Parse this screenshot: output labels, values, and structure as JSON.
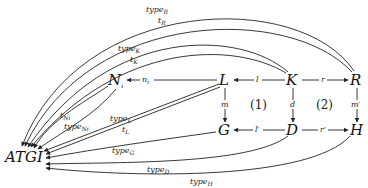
{
  "diagram": {
    "type": "commutative-diagram",
    "nodes": {
      "atgi": "ATGI",
      "ni": "N",
      "ni_sub": "i",
      "l": "L",
      "k": "K",
      "r": "R",
      "g": "G",
      "d": "D",
      "h": "H"
    },
    "regions": {
      "one": "(1)",
      "two": "(2)"
    },
    "edges": {
      "ni": {
        "base": "n",
        "sub": "i",
        "from": "L",
        "to": "N_i"
      },
      "l": {
        "base": "l",
        "from": "K",
        "to": "L"
      },
      "r": {
        "base": "r",
        "from": "K",
        "to": "R"
      },
      "m": {
        "base": "m",
        "from": "L",
        "to": "G"
      },
      "d": {
        "base": "d",
        "from": "K",
        "to": "D"
      },
      "mprime": {
        "base": "m′",
        "from": "R",
        "to": "H"
      },
      "lprime": {
        "base": "l′",
        "from": "D",
        "to": "G"
      },
      "rprime": {
        "base": "r′",
        "from": "D",
        "to": "H"
      },
      "type_r": {
        "base": "type",
        "sub": "R",
        "from": "R",
        "to": "ATGI"
      },
      "t_r": {
        "base": "t",
        "sub": "R",
        "from": "R",
        "to": "ATGI"
      },
      "type_k": {
        "base": "type",
        "sub": "K",
        "from": "K",
        "to": "ATGI"
      },
      "t_k": {
        "base": "t",
        "sub": "K",
        "from": "K",
        "to": "ATGI"
      },
      "t_ni": {
        "base": "t",
        "sub": "Ni",
        "from": "N_i",
        "to": "ATGI"
      },
      "type_ni": {
        "base": "type",
        "sub": "Ni",
        "from": "N_i",
        "to": "ATGI"
      },
      "type_l": {
        "base": "type",
        "sub": "L",
        "from": "L",
        "to": "ATGI"
      },
      "t_l": {
        "base": "t",
        "sub": "L",
        "from": "L",
        "to": "ATGI"
      },
      "type_g": {
        "base": "type",
        "sub": "G",
        "from": "G",
        "to": "ATGI"
      },
      "type_d": {
        "base": "type",
        "sub": "D",
        "from": "D",
        "to": "ATGI"
      },
      "type_h": {
        "base": "type",
        "sub": "H",
        "from": "H",
        "to": "ATGI"
      }
    }
  }
}
